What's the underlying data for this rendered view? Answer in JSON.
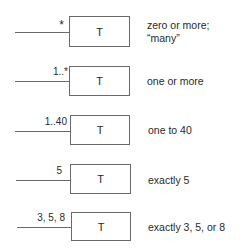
{
  "rows": [
    {
      "multiplicity": "*",
      "class_name": "T",
      "description_lines": [
        "zero or more;",
        "“many”"
      ]
    },
    {
      "multiplicity": "1..*",
      "class_name": "T",
      "description_lines": [
        "one or more"
      ]
    },
    {
      "multiplicity": "1..40",
      "class_name": "T",
      "description_lines": [
        "one to 40"
      ]
    },
    {
      "multiplicity": "5",
      "class_name": "T",
      "description_lines": [
        "exactly 5"
      ]
    },
    {
      "multiplicity": "3, 5, 8",
      "class_name": "T",
      "description_lines": [
        "exactly 3, 5, or 8"
      ]
    }
  ]
}
